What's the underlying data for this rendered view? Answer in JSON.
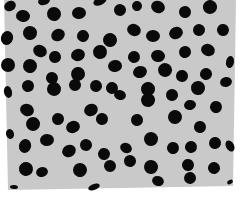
{
  "image": {
    "subject": "polka-dot fabric swatch",
    "background_color": "#ffffff",
    "fabric_color": "#c9c9c9",
    "dot_color": "#0a0a0a",
    "fabric_polygon": "4,0 236,0 233,186 8,190",
    "dots": [
      [
        10,
        6,
        6,
        5
      ],
      [
        23,
        16,
        7,
        6
      ],
      [
        44,
        1,
        6,
        4
      ],
      [
        54,
        14,
        7,
        7
      ],
      [
        79,
        13,
        7,
        6
      ],
      [
        100,
        1,
        7,
        4
      ],
      [
        120,
        10,
        6,
        6
      ],
      [
        137,
        6,
        5,
        5
      ],
      [
        158,
        7,
        7,
        6
      ],
      [
        185,
        12,
        6,
        6
      ],
      [
        210,
        7,
        7,
        7
      ],
      [
        7,
        38,
        6,
        7
      ],
      [
        30,
        33,
        7,
        7
      ],
      [
        58,
        35,
        7,
        6
      ],
      [
        83,
        36,
        6,
        6
      ],
      [
        110,
        40,
        7,
        7
      ],
      [
        134,
        30,
        7,
        6
      ],
      [
        153,
        36,
        7,
        6
      ],
      [
        176,
        33,
        7,
        6
      ],
      [
        199,
        30,
        6,
        6
      ],
      [
        223,
        30,
        6,
        6
      ],
      [
        40,
        51,
        7,
        6
      ],
      [
        55,
        57,
        6,
        6
      ],
      [
        78,
        55,
        7,
        6
      ],
      [
        100,
        52,
        7,
        7
      ],
      [
        115,
        66,
        7,
        6
      ],
      [
        134,
        57,
        6,
        6
      ],
      [
        158,
        56,
        7,
        6
      ],
      [
        185,
        52,
        6,
        6
      ],
      [
        208,
        50,
        7,
        6
      ],
      [
        8,
        65,
        7,
        7
      ],
      [
        30,
        66,
        7,
        7
      ],
      [
        52,
        78,
        6,
        6
      ],
      [
        78,
        74,
        7,
        7
      ],
      [
        96,
        86,
        6,
        6
      ],
      [
        112,
        88,
        6,
        6
      ],
      [
        140,
        72,
        7,
        6
      ],
      [
        165,
        70,
        7,
        7
      ],
      [
        182,
        76,
        6,
        6
      ],
      [
        206,
        74,
        6,
        6
      ],
      [
        230,
        62,
        4,
        6
      ],
      [
        8,
        92,
        4,
        6
      ],
      [
        28,
        86,
        6,
        6
      ],
      [
        54,
        89,
        7,
        7
      ],
      [
        75,
        85,
        6,
        6
      ],
      [
        120,
        95,
        6,
        5
      ],
      [
        148,
        89,
        7,
        7
      ],
      [
        172,
        95,
        6,
        6
      ],
      [
        198,
        88,
        7,
        7
      ],
      [
        226,
        82,
        6,
        5
      ],
      [
        27,
        110,
        7,
        6
      ],
      [
        58,
        119,
        6,
        6
      ],
      [
        91,
        110,
        7,
        6
      ],
      [
        148,
        100,
        7,
        7
      ],
      [
        190,
        105,
        6,
        5
      ],
      [
        216,
        107,
        6,
        6
      ],
      [
        33,
        124,
        7,
        7
      ],
      [
        73,
        127,
        7,
        6
      ],
      [
        102,
        119,
        6,
        6
      ],
      [
        137,
        120,
        6,
        6
      ],
      [
        175,
        117,
        7,
        7
      ],
      [
        200,
        127,
        6,
        6
      ],
      [
        10,
        134,
        4,
        5
      ],
      [
        25,
        146,
        6,
        7
      ],
      [
        47,
        140,
        7,
        6
      ],
      [
        69,
        151,
        7,
        6
      ],
      [
        86,
        145,
        6,
        6
      ],
      [
        104,
        154,
        6,
        6
      ],
      [
        126,
        148,
        6,
        5
      ],
      [
        151,
        139,
        7,
        7
      ],
      [
        173,
        148,
        6,
        6
      ],
      [
        191,
        147,
        6,
        6
      ],
      [
        215,
        143,
        6,
        6
      ],
      [
        230,
        146,
        4,
        6
      ],
      [
        26,
        169,
        7,
        7
      ],
      [
        42,
        172,
        6,
        5
      ],
      [
        80,
        170,
        7,
        7
      ],
      [
        110,
        166,
        6,
        6
      ],
      [
        130,
        161,
        6,
        6
      ],
      [
        151,
        167,
        7,
        7
      ],
      [
        188,
        165,
        6,
        6
      ],
      [
        214,
        168,
        6,
        6
      ],
      [
        14,
        187,
        4,
        2
      ],
      [
        94,
        187,
        6,
        3
      ],
      [
        158,
        181,
        6,
        5
      ],
      [
        190,
        178,
        6,
        6
      ],
      [
        230,
        182,
        3,
        2
      ]
    ]
  }
}
